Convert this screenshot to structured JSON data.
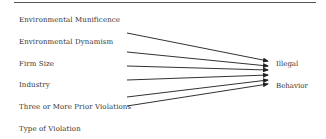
{
  "diagram": {
    "predictors": [
      {
        "label": "Environmental Munificence",
        "y": 21
      },
      {
        "label": "Environmental Dynamism",
        "y": 43
      },
      {
        "label": "Firm Size",
        "y": 65
      },
      {
        "label": "Industry",
        "y": 86
      },
      {
        "label": "Three or More Prior Violations",
        "y": 108
      },
      {
        "label": "Type of Violation",
        "y": 130
      }
    ],
    "outcome": {
      "line1": "Illegal",
      "line2": "Behavior"
    },
    "arrows": [
      {
        "x1": 127,
        "y1": 33,
        "x2": 268,
        "y2": 61
      },
      {
        "x1": 127,
        "y1": 52,
        "x2": 268,
        "y2": 66
      },
      {
        "x1": 127,
        "y1": 66,
        "x2": 268,
        "y2": 70
      },
      {
        "x1": 127,
        "y1": 80,
        "x2": 268,
        "y2": 75
      },
      {
        "x1": 127,
        "y1": 97,
        "x2": 268,
        "y2": 80
      },
      {
        "x1": 127,
        "y1": 106,
        "x2": 268,
        "y2": 84
      }
    ],
    "colors": {
      "line": "#333333",
      "text": "#333333",
      "rule": "#555555"
    }
  }
}
